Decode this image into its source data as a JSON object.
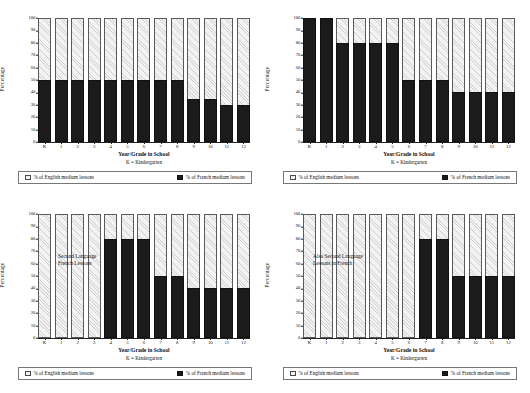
{
  "figure": {
    "common": {
      "ylabel": "Percentage",
      "xlabel": "Year/Grade in School",
      "xnote": "K = Kindergarten",
      "yticks": [
        "0",
        "10",
        "20",
        "30",
        "40",
        "50",
        "60",
        "70",
        "80",
        "90",
        "100"
      ],
      "categories": [
        "K",
        "1",
        "2",
        "3",
        "4",
        "5",
        "6",
        "7",
        "8",
        "9",
        "10",
        "11",
        "12"
      ],
      "legend": {
        "english_label": "% of English medium lessons",
        "french_label": "% of French medium lessons",
        "english_color": "#f2f2f2",
        "french_color": "#1b1b1b"
      }
    }
  },
  "chart_data": [
    {
      "id": "panel-top-left",
      "type": "bar",
      "title": "",
      "xlabel": "Year/Grade in School",
      "ylabel": "Percentage",
      "ylim": [
        0,
        100
      ],
      "grid": false,
      "stacked": true,
      "legend_position": "bottom",
      "categories": [
        "K",
        "1",
        "2",
        "3",
        "4",
        "5",
        "6",
        "7",
        "8",
        "9",
        "10",
        "11",
        "12"
      ],
      "series": [
        {
          "name": "% of French medium lessons",
          "values": [
            50,
            50,
            50,
            50,
            50,
            50,
            50,
            50,
            50,
            35,
            35,
            30,
            30
          ]
        },
        {
          "name": "% of English medium lessons",
          "values": [
            50,
            50,
            50,
            50,
            50,
            50,
            50,
            50,
            50,
            65,
            65,
            70,
            70
          ]
        }
      ],
      "annotation": ""
    },
    {
      "id": "panel-top-right",
      "type": "bar",
      "title": "",
      "xlabel": "Year/Grade in School",
      "ylabel": "Percentage",
      "ylim": [
        0,
        100
      ],
      "grid": false,
      "stacked": true,
      "legend_position": "bottom",
      "categories": [
        "K",
        "1",
        "2",
        "3",
        "4",
        "5",
        "6",
        "7",
        "8",
        "9",
        "10",
        "11",
        "12"
      ],
      "series": [
        {
          "name": "% of French medium lessons",
          "values": [
            100,
            100,
            80,
            80,
            80,
            80,
            50,
            50,
            50,
            40,
            40,
            40,
            40
          ]
        },
        {
          "name": "% of English medium lessons",
          "values": [
            0,
            0,
            20,
            20,
            20,
            20,
            50,
            50,
            50,
            60,
            60,
            60,
            60
          ]
        }
      ],
      "annotation": ""
    },
    {
      "id": "panel-bottom-left",
      "type": "bar",
      "title": "",
      "xlabel": "Year/Grade in School",
      "ylabel": "Percentage",
      "ylim": [
        0,
        100
      ],
      "grid": false,
      "stacked": true,
      "legend_position": "bottom",
      "categories": [
        "K",
        "1",
        "2",
        "3",
        "4",
        "5",
        "6",
        "7",
        "8",
        "9",
        "10",
        "11",
        "12"
      ],
      "series": [
        {
          "name": "% of French medium lessons",
          "values": [
            0,
            0,
            0,
            0,
            80,
            80,
            80,
            50,
            50,
            40,
            40,
            40,
            40
          ]
        },
        {
          "name": "% of English medium lessons",
          "values": [
            100,
            100,
            100,
            100,
            20,
            20,
            20,
            50,
            50,
            60,
            60,
            60,
            60
          ]
        }
      ],
      "annotation": "Second Language\nFrench Lessons"
    },
    {
      "id": "panel-bottom-right",
      "type": "bar",
      "title": "",
      "xlabel": "Year/Grade in School",
      "ylabel": "Percentage",
      "ylim": [
        0,
        100
      ],
      "grid": false,
      "stacked": true,
      "legend_position": "bottom",
      "categories": [
        "K",
        "1",
        "2",
        "3",
        "4",
        "5",
        "6",
        "7",
        "8",
        "9",
        "10",
        "11",
        "12"
      ],
      "series": [
        {
          "name": "% of French medium lessons",
          "values": [
            0,
            0,
            0,
            0,
            0,
            0,
            0,
            80,
            80,
            50,
            50,
            50,
            50
          ]
        },
        {
          "name": "% of English medium lessons",
          "values": [
            100,
            100,
            100,
            100,
            100,
            100,
            100,
            20,
            20,
            50,
            50,
            50,
            50
          ]
        }
      ],
      "annotation": "Also Second Language\nLessons in French"
    }
  ]
}
